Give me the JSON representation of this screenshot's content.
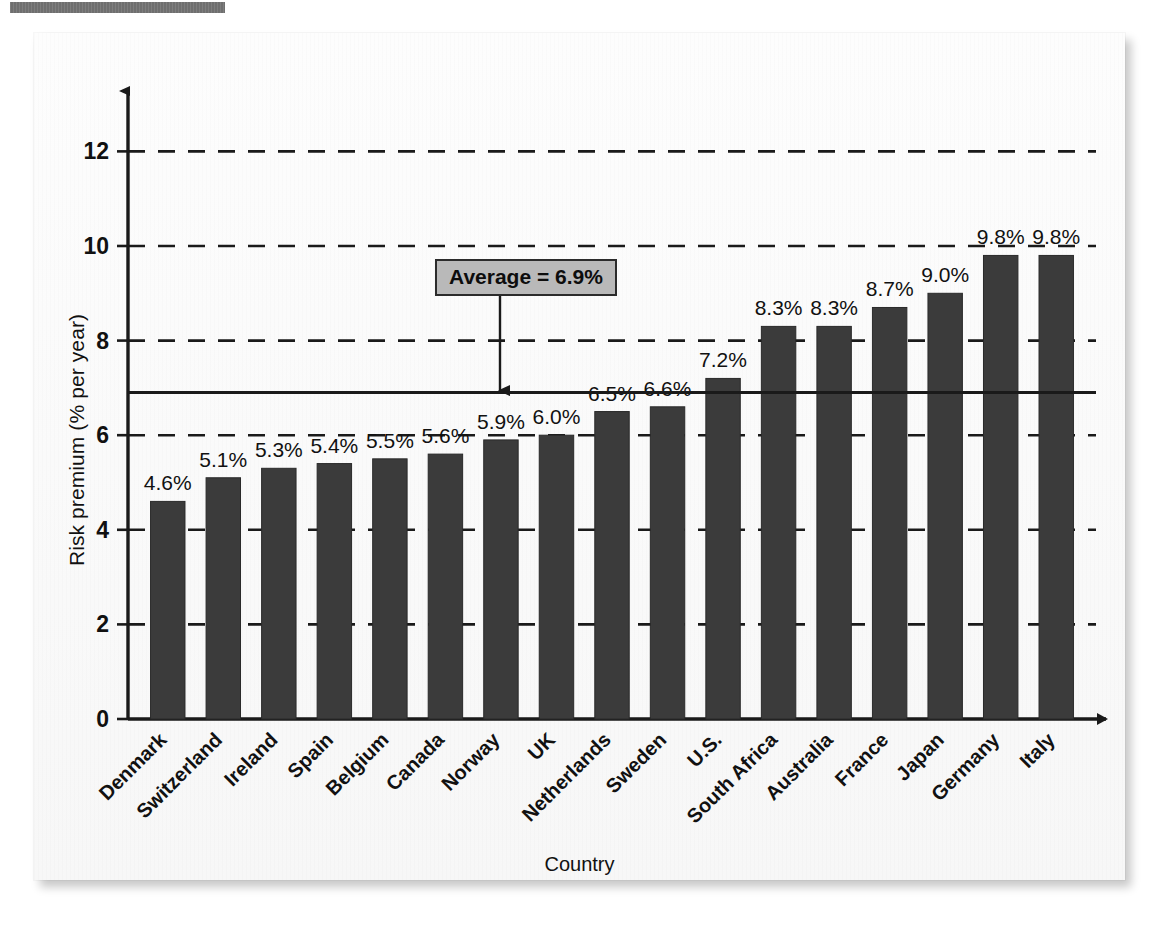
{
  "header": {
    "strip_label": ""
  },
  "chart_data": {
    "type": "bar",
    "title": "",
    "xlabel": "Country",
    "ylabel": "Risk premium (% per year)",
    "ylim": [
      0,
      12.6
    ],
    "yticks": [
      0,
      2,
      4,
      6,
      8,
      10,
      12
    ],
    "ytick_labels": [
      "0",
      "2",
      "4",
      "6",
      "8",
      "10",
      "12"
    ],
    "grid": "horizontal-dashed",
    "legend": "none",
    "categories": [
      "Denmark",
      "Switzerland",
      "Ireland",
      "Spain",
      "Belgium",
      "Canada",
      "Norway",
      "UK",
      "Netherlands",
      "Sweden",
      "U.S.",
      "South Africa",
      "Australia",
      "France",
      "Japan",
      "Germany",
      "Italy"
    ],
    "values": [
      4.6,
      5.1,
      5.3,
      5.4,
      5.5,
      5.6,
      5.9,
      6.0,
      6.5,
      6.6,
      7.2,
      8.3,
      8.3,
      8.7,
      9.0,
      9.8,
      9.8
    ],
    "value_labels": [
      "4.6%",
      "5.1%",
      "5.3%",
      "5.4%",
      "5.5%",
      "5.6%",
      "5.9%",
      "6.0%",
      "6.5%",
      "6.6%",
      "7.2%",
      "8.3%",
      "8.3%",
      "8.7%",
      "9.0%",
      "9.8%",
      "9.8%"
    ],
    "annotations": [
      {
        "name": "average-line",
        "label": "Average = 6.9%",
        "value": 6.9,
        "style": "solid-horizontal-line-with-arrow-callout"
      }
    ],
    "colors": {
      "bar": "#3b3b3b",
      "axis": "#1a1a1a",
      "grid": "#1a1a1a",
      "callout_fill": "#b9b9b9",
      "callout_border": "#2b2b2b",
      "background": "#fbfbfb"
    }
  },
  "annotation": {
    "average_label": "Average = 6.9%"
  }
}
